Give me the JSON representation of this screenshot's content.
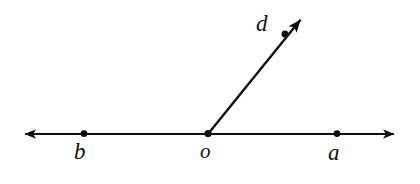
{
  "diagram": {
    "type": "geometry-figure",
    "background_color": "#ffffff",
    "stroke_color": "#100f0f",
    "stroke_width": 2.2,
    "labels": {
      "a": "a",
      "b": "b",
      "o": "o",
      "d": "d"
    },
    "points": [
      {
        "name": "b",
        "label": "b",
        "x": 84,
        "y": 134
      },
      {
        "name": "o",
        "label": "o",
        "x": 208,
        "y": 134
      },
      {
        "name": "a",
        "label": "a",
        "x": 337,
        "y": 134
      },
      {
        "name": "d",
        "label": "d",
        "x": 285,
        "y": 34
      }
    ],
    "lines": [
      {
        "name": "line-ba",
        "kind": "double-arrow-line",
        "x1": 17,
        "y1": 134,
        "x2": 402,
        "y2": 134
      },
      {
        "name": "ray-od",
        "kind": "single-arrow-ray",
        "x1": 208,
        "y1": 134,
        "x2": 310,
        "y2": 8
      }
    ]
  }
}
